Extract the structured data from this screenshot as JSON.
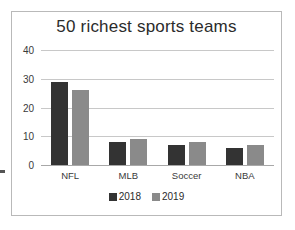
{
  "chart_data": {
    "type": "bar",
    "title": "50 richest sports teams",
    "xlabel": "",
    "ylabel": "",
    "categories": [
      "NFL",
      "MLB",
      "Soccer",
      "NBA"
    ],
    "series": [
      {
        "name": "2018",
        "color": "#333333",
        "values": [
          29,
          8,
          7,
          6
        ]
      },
      {
        "name": "2019",
        "color": "#8a8a8a",
        "values": [
          26,
          9,
          8,
          7
        ]
      }
    ],
    "ylim": [
      0,
      40
    ],
    "yticks": [
      0,
      10,
      20,
      30,
      40
    ],
    "ytick_labels": [
      "0",
      "10",
      "20",
      "30",
      "40"
    ],
    "grid": "horizontal",
    "legend_position": "bottom-center"
  },
  "frame": {
    "border_color": "#b9b9b9",
    "background": "#ffffff"
  }
}
